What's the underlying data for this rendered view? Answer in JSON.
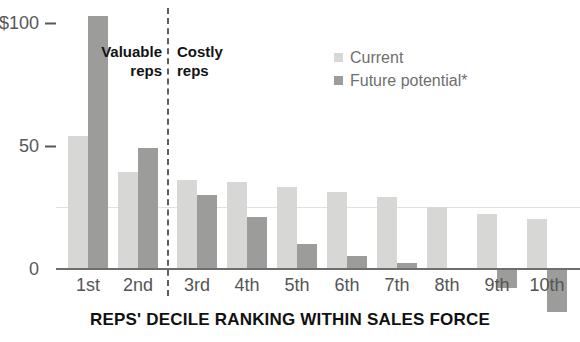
{
  "chart_data": {
    "type": "bar",
    "title": "Why Top Reps Deserve a Bigger Slice (in thousands)",
    "xlabel": "REPS' DECILE RANKING WITHIN SALES FORCE",
    "ylabel": "",
    "ylim": [
      -18,
      110
    ],
    "grid": true,
    "legend_position": "top-right",
    "categories": [
      "1st",
      "2nd",
      "3rd",
      "4th",
      "5th",
      "6th",
      "7th",
      "8th",
      "9th",
      "10th"
    ],
    "series": [
      {
        "name": "Current",
        "color": "#d7d7d5",
        "values": [
          54,
          39,
          36,
          35,
          33,
          31,
          29,
          25,
          22,
          20
        ]
      },
      {
        "name": "Future potential*",
        "color": "#9c9c9a",
        "values": [
          103,
          49,
          30,
          21,
          10,
          5,
          2,
          0,
          -8,
          -18
        ]
      }
    ],
    "y_ticks": [
      {
        "value": 100,
        "label": "$100"
      },
      {
        "value": 50,
        "label": "50"
      },
      {
        "value": 0,
        "label": "0"
      }
    ],
    "annotations": [
      {
        "name": "valuable-reps",
        "text": "Valuable\nreps"
      },
      {
        "name": "costly-reps",
        "text": "Costly\nreps"
      }
    ],
    "divider": {
      "after_category": "2nd",
      "style": "dashed"
    }
  },
  "legend": {
    "items": [
      {
        "label": "Current",
        "swatch": "current-swatch"
      },
      {
        "label": "Future potential*",
        "swatch": "future-swatch"
      }
    ]
  }
}
